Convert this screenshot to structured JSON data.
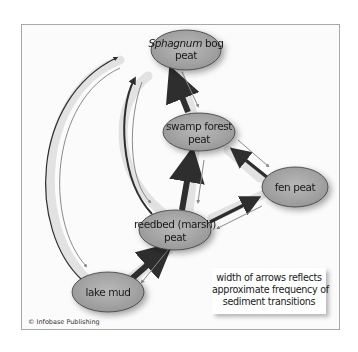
{
  "diagram": {
    "nodes": [
      {
        "id": "sphagnum",
        "label_italic": "Sphagnum",
        "label_rest": " bog",
        "label_line2": "peat",
        "cx": 186,
        "cy": 50
      },
      {
        "id": "swamp",
        "label_line1": "swamp forest",
        "label_line2": "peat",
        "cx": 199,
        "cy": 132
      },
      {
        "id": "fen",
        "label_line1": "fen peat",
        "cx": 295,
        "cy": 187
      },
      {
        "id": "reedbed",
        "label_line1": "reedbed (marsh)",
        "label_line2": "peat",
        "cx": 175,
        "cy": 230
      },
      {
        "id": "lakemud",
        "label_line1": "lake mud",
        "cx": 108,
        "cy": 292
      }
    ],
    "edges": [
      {
        "from": "lakemud",
        "to": "reedbed",
        "weight": "heavy"
      },
      {
        "from": "reedbed",
        "to": "lakemud",
        "weight": "light"
      },
      {
        "from": "reedbed",
        "to": "swamp",
        "weight": "heavy"
      },
      {
        "from": "swamp",
        "to": "reedbed",
        "weight": "light"
      },
      {
        "from": "reedbed",
        "to": "fen",
        "weight": "medium"
      },
      {
        "from": "fen",
        "to": "reedbed",
        "weight": "light"
      },
      {
        "from": "fen",
        "to": "swamp",
        "weight": "medium"
      },
      {
        "from": "swamp",
        "to": "fen",
        "weight": "light"
      },
      {
        "from": "swamp",
        "to": "sphagnum",
        "weight": "heavy"
      },
      {
        "from": "sphagnum",
        "to": "swamp",
        "weight": "light"
      },
      {
        "from": "reedbed",
        "to": "sphagnum",
        "weight": "medium"
      },
      {
        "from": "sphagnum",
        "to": "reedbed",
        "weight": "light"
      },
      {
        "from": "lakemud",
        "to": "sphagnum",
        "weight": "light-dark"
      },
      {
        "from": "sphagnum",
        "to": "lakemud",
        "weight": "light"
      }
    ],
    "colors": {
      "node_fill": "#a9a9a9",
      "node_stroke": "#3a3a3a",
      "heavy_arrow": "#2e2e2e",
      "light_arrow": "#8a8a8a",
      "arrow_halo": "#dcdcdc"
    }
  },
  "legend": {
    "line1": "width of arrows reflects",
    "line2": "approximate frequency of",
    "line3": "sediment transitions"
  },
  "credit": "© Infobase Publishing"
}
